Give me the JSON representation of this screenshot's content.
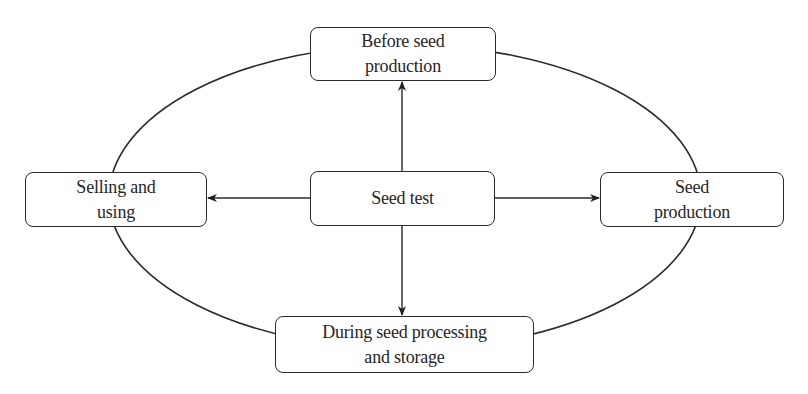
{
  "diagram": {
    "type": "cycle-with-hub",
    "colors": {
      "stroke": "#2a2a2a",
      "text": "#262626",
      "background": "#ffffff"
    },
    "hub": {
      "id": "seed-test",
      "label": "Seed test"
    },
    "nodes": [
      {
        "id": "before-seed-production",
        "position": "top",
        "lines": [
          "Before seed",
          "production"
        ]
      },
      {
        "id": "seed-production",
        "position": "right",
        "lines": [
          "Seed",
          "production"
        ]
      },
      {
        "id": "during-processing",
        "position": "bottom",
        "lines": [
          "During seed processing",
          "and storage"
        ]
      },
      {
        "id": "selling-and-using",
        "position": "left",
        "lines": [
          "Selling and",
          "using"
        ]
      }
    ],
    "edges": [
      {
        "from": "seed-test",
        "to": "before-seed-production",
        "arrow": "end"
      },
      {
        "from": "seed-test",
        "to": "seed-production",
        "arrow": "end"
      },
      {
        "from": "seed-test",
        "to": "during-processing",
        "arrow": "end"
      },
      {
        "from": "seed-test",
        "to": "selling-and-using",
        "arrow": "end"
      }
    ],
    "cycle": {
      "shape": "ellipse",
      "connects": [
        "before-seed-production",
        "seed-production",
        "during-processing",
        "selling-and-using"
      ]
    }
  }
}
